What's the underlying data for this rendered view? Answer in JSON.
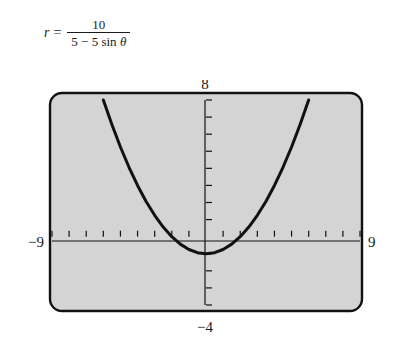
{
  "equation": {
    "lhs": "r",
    "equals": "=",
    "numerator": "10",
    "denominator_prefix": "5",
    "denominator_minus": "−",
    "denominator_coefficient": "5",
    "denominator_function": "sin",
    "denominator_variable": "θ",
    "full_text": "r = 10 / (5 − 5 sin θ)"
  },
  "plot": {
    "background_color": "#d4d4d4",
    "frame_color": "#111111",
    "axis_color": "#111111",
    "curve_color": "#111111",
    "labels": {
      "top": "8",
      "bottom": "−4",
      "left": "−9",
      "right": "9"
    }
  },
  "chart_data": {
    "type": "line",
    "title": "",
    "subtitle": "",
    "xlabel": "",
    "ylabel": "",
    "equation": "r = 10/(5 − 5 sin θ)",
    "cartesian_form": "y = x²/4 − 1",
    "xlim": [
      -9,
      9
    ],
    "ylim": [
      -4,
      8
    ],
    "xtick_step": 1,
    "ytick_step": 1,
    "xticks": [
      -9,
      -8,
      -7,
      -6,
      -5,
      -4,
      -3,
      -2,
      -1,
      0,
      1,
      2,
      3,
      4,
      5,
      6,
      7,
      8,
      9
    ],
    "yticks": [
      -4,
      -3,
      -2,
      -1,
      0,
      1,
      2,
      3,
      4,
      5,
      6,
      7,
      8
    ],
    "grid": false,
    "legend": "none",
    "axis_tick_labels_shown": false,
    "window_labels": {
      "xmin": "−9",
      "xmax": "9",
      "ymax": "8",
      "ymin": "−4"
    },
    "vertex": [
      0,
      -1
    ],
    "directrix": -2,
    "focus": [
      0,
      0
    ],
    "series": [
      {
        "name": "r = 10/(5 − 5 sin θ)",
        "x": [
          -6.0,
          -5.5,
          -5.0,
          -4.5,
          -4.0,
          -3.5,
          -3.0,
          -2.5,
          -2.0,
          -1.5,
          -1.0,
          -0.5,
          0.0,
          0.5,
          1.0,
          1.5,
          2.0,
          2.5,
          3.0,
          3.5,
          4.0,
          4.5,
          5.0,
          5.5,
          6.0
        ],
        "y": [
          8.0,
          6.5625,
          5.25,
          4.0625,
          3.0,
          2.0625,
          1.25,
          0.5625,
          0.0,
          -0.4375,
          -0.75,
          -0.9375,
          -1.0,
          -0.9375,
          -0.75,
          -0.4375,
          0.0,
          0.5625,
          1.25,
          2.0625,
          3.0,
          4.0625,
          5.25,
          6.5625,
          8.0
        ]
      }
    ]
  }
}
